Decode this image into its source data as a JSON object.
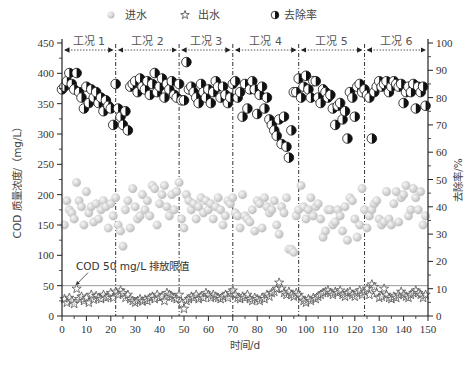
{
  "chart_data": {
    "type": "scatter",
    "title": "",
    "xlabel": "时间/d",
    "ylabel": "COD 质量浓度/（mg/L）",
    "y2label": "去除率/%",
    "xlim": [
      0,
      150
    ],
    "ylim": [
      0,
      450
    ],
    "y2lim": [
      0,
      100
    ],
    "x_ticks": [
      0,
      10,
      20,
      30,
      40,
      50,
      60,
      70,
      80,
      90,
      100,
      110,
      120,
      130,
      140,
      150
    ],
    "y_ticks": [
      0,
      50,
      100,
      150,
      200,
      250,
      300,
      350,
      400,
      450
    ],
    "y2_ticks": [
      0,
      10,
      20,
      30,
      40,
      50,
      60,
      70,
      80,
      90,
      100
    ],
    "grid": false,
    "legend_position": "top",
    "legend": [
      {
        "key": "influent",
        "label": "进水",
        "marker": "gray-sphere"
      },
      {
        "key": "effluent",
        "label": "出水",
        "marker": "open-star"
      },
      {
        "key": "removal",
        "label": "去除率",
        "marker": "half-filled-circle"
      }
    ],
    "phases": [
      {
        "label": "工况 1",
        "start": 0,
        "end": 22
      },
      {
        "label": "工况 2",
        "start": 22,
        "end": 48
      },
      {
        "label": "工况 3",
        "start": 48,
        "end": 70
      },
      {
        "label": "工况 4",
        "start": 70,
        "end": 97
      },
      {
        "label": "工况 5",
        "start": 97,
        "end": 124
      },
      {
        "label": "工况 6",
        "start": 124,
        "end": 150
      }
    ],
    "annotation": {
      "text": "COD 50 mg/L 排放限值",
      "limit_value": 50,
      "arrow_to_x": 5
    },
    "series": [
      {
        "name": "进水",
        "axis": "left",
        "x": [
          1,
          2,
          3,
          4,
          5,
          6,
          7,
          8,
          9,
          10,
          11,
          12,
          13,
          14,
          15,
          16,
          17,
          18,
          19,
          20,
          21,
          22,
          23,
          24,
          25,
          26,
          27,
          28,
          29,
          30,
          31,
          32,
          33,
          34,
          35,
          36,
          37,
          38,
          39,
          40,
          41,
          42,
          43,
          44,
          45,
          46,
          47,
          48,
          49,
          50,
          51,
          52,
          53,
          54,
          55,
          56,
          57,
          58,
          59,
          60,
          61,
          62,
          63,
          64,
          65,
          66,
          67,
          68,
          69,
          70,
          71,
          72,
          73,
          74,
          75,
          76,
          77,
          78,
          79,
          80,
          81,
          82,
          83,
          84,
          85,
          86,
          87,
          88,
          89,
          90,
          91,
          92,
          93,
          94,
          95,
          96,
          97,
          98,
          99,
          100,
          101,
          102,
          103,
          104,
          105,
          106,
          107,
          108,
          109,
          110,
          111,
          112,
          113,
          114,
          115,
          116,
          117,
          118,
          119,
          120,
          121,
          122,
          123,
          124,
          125,
          126,
          127,
          128,
          129,
          130,
          131,
          132,
          133,
          134,
          135,
          136,
          137,
          138,
          139,
          140,
          141,
          142,
          143,
          144,
          145,
          146,
          147,
          148,
          149
        ],
        "values": [
          150,
          190,
          175,
          170,
          160,
          220,
          190,
          180,
          150,
          205,
          170,
          180,
          155,
          185,
          160,
          175,
          190,
          180,
          145,
          185,
          165,
          195,
          150,
          140,
          115,
          175,
          190,
          145,
          210,
          180,
          160,
          165,
          200,
          175,
          190,
          165,
          215,
          210,
          150,
          185,
          200,
          215,
          180,
          165,
          200,
          175,
          205,
          220,
          160,
          145,
          200,
          190,
          175,
          185,
          160,
          180,
          195,
          170,
          190,
          175,
          185,
          160,
          180,
          195,
          175,
          150,
          165,
          190,
          185,
          195,
          170,
          165,
          145,
          200,
          165,
          160,
          155,
          175,
          140,
          190,
          185,
          145,
          195,
          180,
          170,
          175,
          190,
          150,
          135,
          180,
          170,
          195,
          110,
          110,
          105,
          165,
          175,
          215,
          180,
          160,
          175,
          195,
          165,
          180,
          185,
          160,
          130,
          140,
          175,
          175,
          150,
          155,
          175,
          165,
          140,
          180,
          125,
          195,
          190,
          160,
          130,
          150,
          210,
          175,
          145,
          165,
          175,
          185,
          190,
          160,
          150,
          155,
          205,
          160,
          150,
          185,
          205,
          155,
          195,
          200,
          215,
          165,
          175,
          210,
          195,
          175,
          205,
          150,
          165
        ],
        "approx": true
      },
      {
        "name": "出水",
        "axis": "left",
        "x": [
          1,
          2,
          3,
          4,
          5,
          6,
          7,
          8,
          9,
          10,
          11,
          12,
          13,
          14,
          15,
          16,
          17,
          18,
          19,
          20,
          21,
          22,
          23,
          24,
          25,
          26,
          27,
          28,
          29,
          30,
          31,
          32,
          33,
          34,
          35,
          36,
          37,
          38,
          39,
          40,
          41,
          42,
          43,
          44,
          45,
          46,
          47,
          48,
          49,
          50,
          51,
          52,
          53,
          54,
          55,
          56,
          57,
          58,
          59,
          60,
          61,
          62,
          63,
          64,
          65,
          66,
          67,
          68,
          69,
          70,
          71,
          72,
          73,
          74,
          75,
          76,
          77,
          78,
          79,
          80,
          81,
          82,
          83,
          84,
          85,
          86,
          87,
          88,
          89,
          90,
          91,
          92,
          93,
          94,
          95,
          96,
          97,
          98,
          99,
          100,
          101,
          102,
          103,
          104,
          105,
          106,
          107,
          108,
          109,
          110,
          111,
          112,
          113,
          114,
          115,
          116,
          117,
          118,
          119,
          120,
          121,
          122,
          123,
          124,
          125,
          126,
          127,
          128,
          129,
          130,
          131,
          132,
          133,
          134,
          135,
          136,
          137,
          138,
          139,
          140,
          141,
          142,
          143,
          144,
          145,
          146,
          147,
          148,
          149
        ],
        "values": [
          28,
          22,
          30,
          25,
          20,
          45,
          28,
          32,
          25,
          30,
          22,
          35,
          27,
          33,
          30,
          28,
          35,
          30,
          32,
          38,
          30,
          40,
          35,
          42,
          38,
          30,
          35,
          28,
          25,
          22,
          25,
          28,
          24,
          27,
          25,
          30,
          32,
          28,
          35,
          30,
          32,
          25,
          38,
          35,
          32,
          30,
          28,
          35,
          20,
          12,
          25,
          28,
          32,
          30,
          35,
          28,
          32,
          30,
          38,
          35,
          30,
          35,
          32,
          30,
          28,
          32,
          35,
          30,
          38,
          42,
          35,
          30,
          28,
          32,
          30,
          35,
          28,
          25,
          30,
          28,
          25,
          30,
          28,
          35,
          32,
          38,
          40,
          45,
          55,
          45,
          38,
          35,
          40,
          35,
          32,
          38,
          35,
          30,
          25,
          22,
          28,
          25,
          30,
          28,
          32,
          35,
          38,
          40,
          42,
          38,
          35,
          40,
          38,
          42,
          35,
          32,
          38,
          40,
          35,
          32,
          38,
          42,
          35,
          40,
          45,
          35,
          52,
          48,
          38,
          30,
          32,
          45,
          35,
          30,
          28,
          32,
          30,
          35,
          40,
          35,
          32,
          30,
          35,
          38,
          42,
          38,
          35,
          30,
          35
        ],
        "approx": true
      },
      {
        "name": "去除率",
        "axis": "right",
        "x": [
          0,
          1,
          2,
          3,
          4,
          5,
          6,
          7,
          8,
          9,
          10,
          11,
          12,
          13,
          14,
          15,
          16,
          17,
          18,
          19,
          20,
          21,
          22,
          23,
          24,
          25,
          26,
          27,
          28,
          29,
          30,
          31,
          32,
          33,
          34,
          35,
          36,
          37,
          38,
          39,
          40,
          41,
          42,
          43,
          44,
          45,
          46,
          47,
          48,
          49,
          50,
          51,
          52,
          53,
          54,
          55,
          56,
          57,
          58,
          59,
          60,
          61,
          62,
          63,
          64,
          65,
          66,
          67,
          68,
          69,
          70,
          71,
          72,
          73,
          74,
          75,
          76,
          77,
          78,
          79,
          80,
          81,
          82,
          83,
          84,
          85,
          86,
          87,
          88,
          89,
          90,
          91,
          92,
          93,
          94,
          95,
          96,
          97,
          98,
          99,
          100,
          101,
          102,
          103,
          104,
          105,
          106,
          107,
          108,
          109,
          110,
          111,
          112,
          113,
          114,
          115,
          116,
          117,
          118,
          119,
          120,
          121,
          122,
          123,
          124,
          125,
          126,
          127,
          128,
          129,
          130,
          131,
          132,
          133,
          134,
          135,
          136,
          137,
          138,
          139,
          140,
          141,
          142,
          143,
          144,
          145,
          146,
          147,
          148,
          149
        ],
        "values": [
          83,
          84,
          86,
          89,
          85,
          83,
          89,
          82,
          80,
          76,
          84,
          78,
          83,
          80,
          82,
          78,
          80,
          75,
          79,
          77,
          76,
          70,
          85,
          76,
          73,
          70,
          75,
          68,
          84,
          85,
          86,
          82,
          87,
          84,
          83,
          86,
          81,
          85,
          89,
          82,
          84,
          87,
          80,
          85,
          83,
          86,
          81,
          80,
          85,
          79,
          79,
          93,
          83,
          84,
          82,
          80,
          78,
          85,
          82,
          80,
          83,
          78,
          82,
          86,
          84,
          80,
          84,
          81,
          78,
          80,
          85,
          86,
          80,
          82,
          73,
          85,
          76,
          83,
          86,
          83,
          74,
          81,
          84,
          76,
          80,
          72,
          70,
          68,
          66,
          72,
          63,
          73,
          62,
          58,
          68,
          82,
          82,
          87,
          80,
          84,
          88,
          83,
          80,
          86,
          86,
          80,
          78,
          83,
          82,
          80,
          81,
          76,
          70,
          77,
          78,
          72,
          75,
          65,
          82,
          80,
          73,
          84,
          85,
          82,
          83,
          81,
          80,
          65,
          82,
          84,
          86,
          84,
          85,
          86,
          82,
          84,
          86,
          85,
          84,
          85,
          78,
          82,
          84,
          82,
          85,
          76,
          84,
          82,
          84,
          77
        ],
        "approx": true
      }
    ]
  },
  "legend": {
    "influent_label": "进水",
    "effluent_label": "出水",
    "removal_label": "去除率"
  },
  "axes": {
    "xlabel": "时间/d",
    "ylabel": "COD 质量浓度/（mg/L）",
    "y2label": "去除率/%"
  },
  "annotation": {
    "limit_text": "COD 50 mg/L 排放限值"
  },
  "colors": {
    "axis": "#222222",
    "influent_fill": "#d9d9d9",
    "influent_highlight": "#f5f5f5",
    "effluent_stroke": "#555555",
    "removal_dark": "#111111",
    "limit_line": "#999999",
    "phase_divider": "#333333"
  }
}
